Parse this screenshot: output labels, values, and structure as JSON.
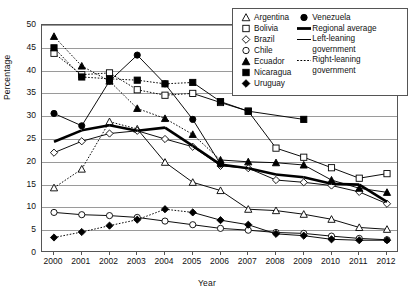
{
  "chart_data": {
    "type": "line",
    "title": "",
    "xlabel": "Year",
    "ylabel": "Percentage",
    "x": [
      2000,
      2001,
      2002,
      2003,
      2004,
      2005,
      2006,
      2007,
      2008,
      2009,
      2010,
      2011,
      2012
    ],
    "xlim": [
      2000,
      2012
    ],
    "ylim": [
      0,
      50
    ],
    "yticks": [
      0,
      5,
      10,
      15,
      20,
      25,
      30,
      35,
      40,
      45,
      50
    ],
    "xticks": [
      "2000",
      "2001",
      "2002",
      "2003",
      "2004",
      "2005",
      "2006",
      "2007",
      "2008",
      "2009",
      "2010",
      "2011",
      "2012"
    ],
    "grid": "horizontal",
    "legend_position": "top-right",
    "series": [
      {
        "name": "Argentina",
        "marker": "triangle-open",
        "linestyle": "mixed",
        "values": [
          14.3,
          18.4,
          28.8,
          27.2,
          19.9,
          15.5,
          13.7,
          9.6,
          9.3,
          8.5,
          7.4,
          5.6,
          5.2
        ],
        "linestyle_segments": [
          "dotted",
          "dotted",
          "dotted",
          "solid",
          "solid",
          "solid",
          "solid",
          "solid",
          "solid",
          "solid",
          "solid",
          "solid"
        ]
      },
      {
        "name": "Bolivia",
        "marker": "square-open",
        "linestyle": "mixed",
        "values": [
          43.8,
          39.1,
          39.5,
          35.8,
          34.6,
          35.0,
          33.0,
          31.1,
          23.0,
          21.0,
          18.7,
          16.4,
          17.4
        ],
        "linestyle_segments": [
          "dotted",
          "dotted",
          "dotted",
          "dotted",
          "dotted",
          "solid",
          "solid",
          "solid",
          "solid",
          "solid",
          "solid",
          "solid"
        ]
      },
      {
        "name": "Brazil",
        "marker": "diamond-open",
        "linestyle": "solid",
        "values": [
          22.0,
          24.5,
          26.2,
          26.8,
          25.0,
          23.3,
          19.1,
          18.6,
          16.0,
          15.5,
          14.8,
          13.4,
          10.8
        ]
      },
      {
        "name": "Chile",
        "marker": "circle-open",
        "linestyle": "solid",
        "values": [
          8.9,
          8.4,
          8.2,
          7.8,
          7.0,
          6.2,
          5.4,
          5.0,
          4.5,
          4.3,
          3.7,
          3.2,
          2.9
        ]
      },
      {
        "name": "Ecuador",
        "marker": "triangle-filled",
        "linestyle": "mixed",
        "values": [
          47.5,
          41.0,
          37.7,
          31.7,
          29.5,
          26.0,
          20.4,
          20.0,
          19.8,
          19.3,
          16.0,
          14.2,
          13.3
        ],
        "linestyle_segments": [
          "dotted",
          "dotted",
          "dotted",
          "dotted",
          "dotted",
          "dotted",
          "solid",
          "solid",
          "solid",
          "solid",
          "solid",
          "solid"
        ]
      },
      {
        "name": "Nicaragua",
        "marker": "square-filled",
        "linestyle": "mixed",
        "values": [
          45.0,
          38.6,
          38.2,
          37.9,
          37.1,
          37.4,
          33.2,
          31.1,
          null,
          29.3,
          null,
          null,
          null
        ],
        "linestyle_segments": [
          "dotted",
          "dotted",
          "dotted",
          "dotted",
          "dotted",
          "solid",
          "solid",
          "solid",
          "solid"
        ]
      },
      {
        "name": "Uruguay",
        "marker": "diamond-filled",
        "linestyle": "mixed",
        "values": [
          3.4,
          4.6,
          6.0,
          7.3,
          9.6,
          8.9,
          7.2,
          6.2,
          4.2,
          3.8,
          3.0,
          2.8,
          2.8
        ],
        "linestyle_segments": [
          "dotted",
          "dotted",
          "dotted",
          "dotted",
          "dotted",
          "solid",
          "solid",
          "solid",
          "solid",
          "solid",
          "solid",
          "solid"
        ]
      },
      {
        "name": "Venezuela",
        "marker": "circle-filled",
        "linestyle": "solid",
        "values": [
          30.6,
          27.9,
          37.7,
          43.4,
          37.1,
          29.3,
          19.5,
          null,
          null,
          null,
          null,
          null,
          null
        ]
      },
      {
        "name": "Regional average",
        "marker": "none",
        "linestyle": "thick",
        "values": [
          24.4,
          26.9,
          28.0,
          26.8,
          27.5,
          23.5,
          19.4,
          18.6,
          17.2,
          16.6,
          15.2,
          15.0,
          11.2
        ]
      }
    ],
    "style_legend": [
      {
        "label": "Left-leaning government",
        "linestyle": "solid"
      },
      {
        "label": "Right-leaning government",
        "linestyle": "dotted"
      }
    ]
  },
  "legend": {
    "left_column": [
      {
        "label": "Argentina",
        "key": "triangle-open-icon"
      },
      {
        "label": "Bolivia",
        "key": "square-open-icon"
      },
      {
        "label": "Brazil",
        "key": "diamond-open-icon"
      },
      {
        "label": "Chile",
        "key": "circle-open-icon"
      },
      {
        "label": "Ecuador",
        "key": "triangle-filled-icon"
      },
      {
        "label": "Nicaragua",
        "key": "square-filled-icon"
      },
      {
        "label": "Uruguay",
        "key": "diamond-filled-icon"
      }
    ],
    "right_column": [
      {
        "label": "Venezuela",
        "key": "circle-filled-icon"
      },
      {
        "label": "Regional average",
        "key": "thick-line-icon"
      },
      {
        "label": "Left-leaning government",
        "key": "thin-line-icon"
      },
      {
        "label": "Right-leaning government",
        "key": "dotted-line-icon"
      }
    ]
  },
  "axes": {
    "y_title": "Percentage",
    "x_title": "Year",
    "y_ticks": [
      "0",
      "5",
      "10",
      "15",
      "20",
      "25",
      "30",
      "35",
      "40",
      "45",
      "50"
    ],
    "x_ticks": [
      "2000",
      "2001",
      "2002",
      "2003",
      "2004",
      "2005",
      "2006",
      "2007",
      "2008",
      "2009",
      "2010",
      "2011",
      "2012"
    ]
  },
  "colors": {
    "series": "#000000",
    "grid": "#9a9a9a",
    "axis": "#555555",
    "background": "#ffffff"
  }
}
